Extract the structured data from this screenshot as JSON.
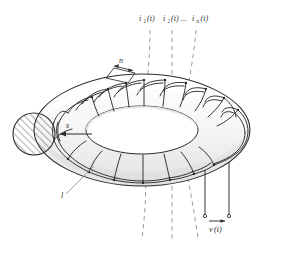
{
  "figure": {
    "background_color": "#ffffff",
    "line_color": "#2b2b2b",
    "torus_fill": "#fbfbfb",
    "torus_shade": "#ebebeb",
    "dash_color": "#8a8a8a",
    "hatch_color": "#4a4a4a"
  },
  "labels": {
    "current_1": "i",
    "current_1_sub": "1",
    "current_1_arg": "(t)",
    "current_2": "i",
    "current_2_sub": "2",
    "current_2_arg": "(t)",
    "ellipsis": "...",
    "current_n": "i",
    "current_n_sub": "n",
    "current_n_arg": "(t)",
    "turns": "n",
    "cross_section": "s",
    "length": "l",
    "voltage": "v",
    "voltage_arg": "(t)"
  },
  "elements": {
    "flux_lines_top_count": 3,
    "flux_lines_bottom_count": 3,
    "winding_turns_visible": 24,
    "cross_section_hatch_lines": 7
  }
}
